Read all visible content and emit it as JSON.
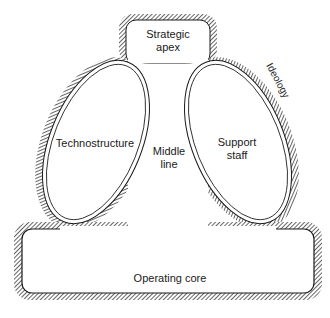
{
  "diagram": {
    "parts": {
      "strategic_apex": {
        "line1": "Strategic",
        "line2": "apex"
      },
      "technostructure": {
        "label": "Technostructure"
      },
      "middle_line": {
        "line1": "Middle",
        "line2": "line"
      },
      "support_staff": {
        "line1": "Support",
        "line2": "staff"
      },
      "ideology": {
        "label": "Ideology"
      },
      "operating_core": {
        "label": "Operating core"
      }
    },
    "colors": {
      "stroke": "#1a1a1a",
      "hatch": "#333333",
      "fill": "#ffffff"
    }
  }
}
